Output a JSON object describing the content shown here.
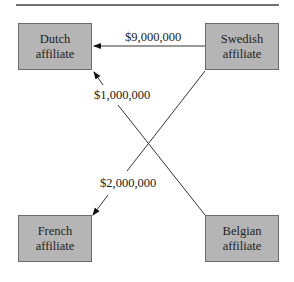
{
  "nodes": {
    "dutch": {
      "line1": "Dutch",
      "line2": "affiliate"
    },
    "swedish": {
      "line1": "Swedish",
      "line2": "affiliate"
    },
    "french": {
      "line1": "French",
      "line2": "affiliate"
    },
    "belgian": {
      "line1": "Belgian",
      "line2": "affiliate"
    }
  },
  "flows": [
    {
      "from": "Swedish affiliate",
      "to": "Dutch affiliate",
      "amount": "$9,000,000"
    },
    {
      "from": "Belgian affiliate",
      "to": "Dutch affiliate",
      "amount": "$1,000,000"
    },
    {
      "from": "Swedish affiliate",
      "to": "French affiliate",
      "amount": "$2,000,000"
    }
  ],
  "colors": {
    "box_fill": "#b5b5b5",
    "box_border": "#6a6a6a",
    "line": "#333333"
  }
}
